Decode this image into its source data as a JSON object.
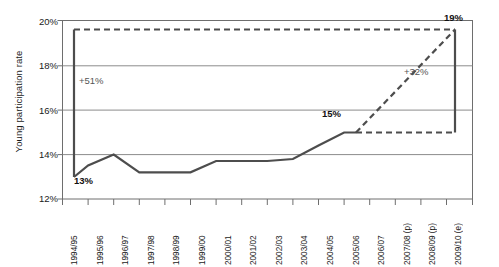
{
  "chart_data": {
    "type": "line",
    "title": "",
    "xlabel": "",
    "ylabel": "Young participation rate",
    "ylim": [
      12,
      20
    ],
    "ytick_labels": [
      "12%",
      "14%",
      "16%",
      "18%",
      "20%"
    ],
    "ytick_values": [
      12,
      14,
      16,
      18,
      20
    ],
    "grid": true,
    "legend": "none",
    "categories": [
      "1994/95",
      "1995/96",
      "1996/97",
      "1997/98",
      "1998/99",
      "1999/00",
      "2000/01",
      "2001/02",
      "2002/03",
      "2003/04",
      "2004/05",
      "2005/06",
      "2006/07",
      "2007/08 (p)",
      "2008/09 (p)",
      "2009/10 (e)"
    ],
    "series": [
      {
        "name": "Young participation rate (actual)",
        "style": "solid",
        "values": [
          13.0,
          13.5,
          14.0,
          13.2,
          13.2,
          13.2,
          13.7,
          13.7,
          13.7,
          13.8,
          14.4,
          15.0,
          15.0,
          null,
          null,
          null
        ]
      },
      {
        "name": "Projection to 2009/10",
        "style": "dashed",
        "values": [
          null,
          null,
          null,
          null,
          null,
          null,
          null,
          null,
          null,
          null,
          null,
          null,
          15.0,
          16.4,
          17.8,
          19.3
        ]
      }
    ],
    "reference_lines": [
      {
        "name": "upper-dashed-reference",
        "style": "dashed",
        "value": 19.3,
        "from_category": "1994/95",
        "to_category": "2009/10 (e)"
      },
      {
        "name": "lower-dashed-reference",
        "style": "dashed",
        "value": 15.0,
        "from_category": "2006/07",
        "to_category": "2009/10 (e)"
      }
    ],
    "connectors": [
      {
        "name": "left-growth-bar",
        "category": "1994/95",
        "from_value": 13.0,
        "to_value": 19.3
      },
      {
        "name": "right-growth-bar",
        "category": "2009/10 (e)",
        "from_value": 15.0,
        "to_value": 19.3
      }
    ],
    "annotations": [
      {
        "name": "growth-left",
        "text": "+51%"
      },
      {
        "name": "growth-right",
        "text": "+32%"
      },
      {
        "name": "start-value",
        "text": "13%"
      },
      {
        "name": "mid-value",
        "text": "15%"
      },
      {
        "name": "end-value",
        "text": "19%"
      }
    ],
    "colors": {
      "line": "#4d4d4d",
      "grid": "#888888",
      "axis": "#555555",
      "annotation_text": "#555555",
      "label_text": "#111111",
      "background": "#ffffff"
    }
  }
}
